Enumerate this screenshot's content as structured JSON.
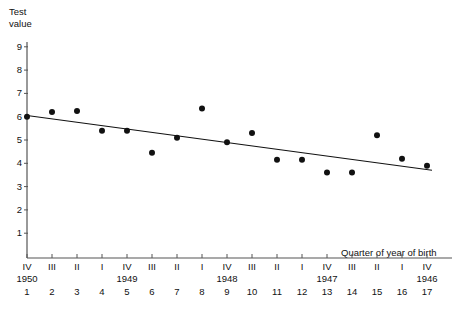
{
  "chart_data": {
    "type": "scatter",
    "title": "",
    "xlabel": "Quarter of year of birth",
    "ylabel": "Test value",
    "ylim": [
      0,
      9.5
    ],
    "yticks": [
      1,
      2,
      3,
      4,
      5,
      6,
      7,
      8,
      9
    ],
    "grid": false,
    "legend": "none",
    "x": [
      1,
      2,
      3,
      4,
      5,
      6,
      7,
      8,
      9,
      10,
      11,
      12,
      13,
      14,
      15,
      16,
      17
    ],
    "values": [
      6.0,
      6.2,
      6.25,
      5.4,
      5.4,
      4.45,
      5.1,
      6.35,
      4.9,
      5.3,
      4.15,
      4.15,
      3.6,
      3.6,
      5.2,
      4.2,
      3.9
    ],
    "xtick_roman": [
      "IV",
      "III",
      "II",
      "I",
      "IV",
      "III",
      "II",
      "I",
      "IV",
      "III",
      "II",
      "I",
      "IV",
      "III",
      "II",
      "I",
      "IV"
    ],
    "xtick_years": [
      "1950",
      "",
      "",
      "",
      "1949",
      "",
      "",
      "",
      "1948",
      "",
      "",
      "",
      "1947",
      "",
      "",
      "",
      "1946"
    ],
    "xtick_index": [
      "1",
      "2",
      "3",
      "4",
      "5",
      "6",
      "7",
      "8",
      "9",
      "10",
      "11",
      "12",
      "13",
      "14",
      "15",
      "16",
      "17"
    ],
    "trendline": {
      "x_start": 1,
      "y_start": 6.05,
      "x_end": 17.2,
      "y_end": 3.7
    },
    "marker_color": "#111111",
    "line_color": "#111111",
    "axis_color": "#555555"
  },
  "axis_titles": {
    "y": "Test\nvalue",
    "x": "Quarter of year of birth"
  }
}
